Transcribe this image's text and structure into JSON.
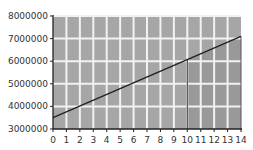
{
  "chart_data": {
    "type": "line",
    "title": "",
    "xlabel": "",
    "ylabel": "",
    "xlim": [
      0,
      14
    ],
    "ylim": [
      3000000,
      8000000
    ],
    "x_ticks": [
      0,
      1,
      2,
      3,
      4,
      5,
      6,
      7,
      8,
      9,
      10,
      11,
      12,
      13,
      14
    ],
    "y_ticks": [
      3000000,
      4000000,
      5000000,
      6000000,
      7000000,
      8000000
    ],
    "y_tick_labels": [
      "3000000",
      "4000000",
      "5000000",
      "6000000",
      "7000000",
      "8000000"
    ],
    "x_tick_labels": [
      "0",
      "1",
      "2",
      "3",
      "4",
      "5",
      "6",
      "7",
      "8",
      "9",
      "10",
      "11",
      "12",
      "13",
      "14"
    ],
    "grid": true,
    "series": [
      {
        "name": "line",
        "x": [
          0,
          14
        ],
        "values": [
          3500000,
          7100000
        ]
      }
    ],
    "annotations": [
      {
        "type": "vertical-line",
        "x": 10,
        "y_top": 6070000
      },
      {
        "type": "shaded-region",
        "x_from": 10,
        "x_to": 14,
        "below_line": true
      }
    ],
    "colors": {
      "plot_background": "#a6a6a6",
      "shaded_region": "#999999",
      "grid": "#f2f2f2",
      "line": "#222222"
    }
  }
}
